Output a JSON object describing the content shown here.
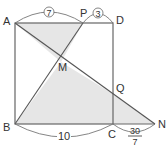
{
  "diagram": {
    "points": {
      "A": {
        "label": "A",
        "x": 15,
        "y": 23
      },
      "P": {
        "label": "P",
        "x": 83,
        "y": 23
      },
      "D": {
        "label": "D",
        "x": 113,
        "y": 23
      },
      "B": {
        "label": "B",
        "x": 15,
        "y": 124
      },
      "C": {
        "label": "C",
        "x": 113,
        "y": 124
      },
      "N": {
        "label": "N",
        "x": 155,
        "y": 124
      },
      "M": {
        "label": "M",
        "x": 61,
        "y": 62
      },
      "Q": {
        "label": "Q",
        "x": 113,
        "y": 94
      }
    },
    "measures": {
      "AP": "7",
      "PD": "3",
      "BC": "10",
      "CN_num": "30",
      "CN_den": "7"
    },
    "colors": {
      "line": "#666666",
      "shade": "#e6e6e6",
      "arc": "#777777"
    }
  }
}
